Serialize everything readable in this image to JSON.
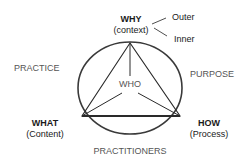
{
  "diagram": {
    "top": {
      "title": "WHY",
      "subtitle": "(context)"
    },
    "branches": [
      "Outer",
      "Inner"
    ],
    "left_arc": "PRACTICE",
    "right_arc": "PURPOSE",
    "center": "WHO",
    "bottom_left": {
      "title": "WHAT",
      "subtitle": "(Content)"
    },
    "bottom_right": {
      "title": "HOW",
      "subtitle": "(Process)"
    },
    "bottom_arc": "PRACTITIONERS",
    "colors": {
      "line": "#3a3a3a",
      "text": "#1a1a1a",
      "label_gray": "#555555"
    }
  }
}
